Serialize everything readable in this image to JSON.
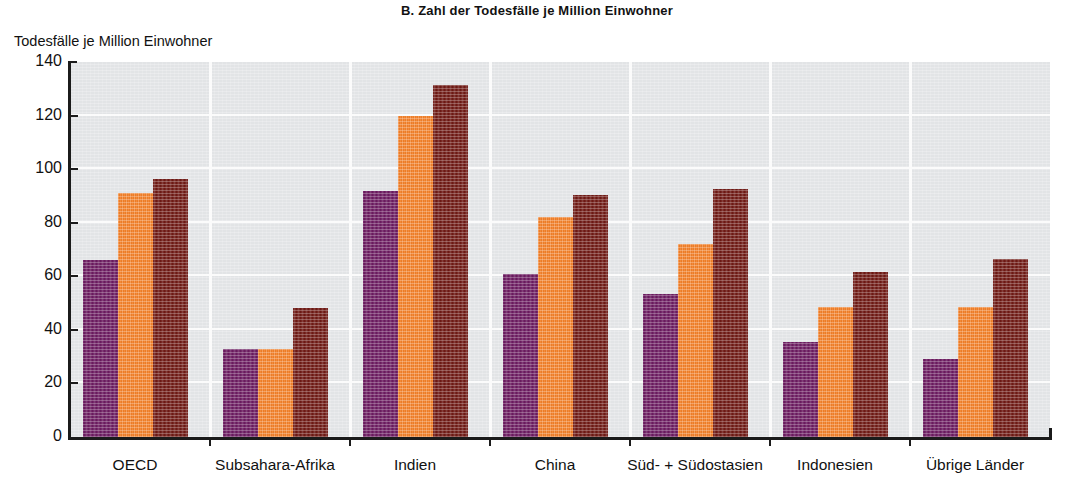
{
  "chart_data": {
    "type": "bar",
    "title": "B. Zahl der Todesfälle je Million Einwohner",
    "ylabel": "Todesfälle je Million Einwohner",
    "xlabel": "",
    "ylim": [
      0,
      140
    ],
    "yticks": [
      0,
      20,
      40,
      60,
      80,
      100,
      120,
      140
    ],
    "ytick_labels": [
      "0",
      "20",
      "40",
      "60",
      "80",
      "100",
      "120",
      "140"
    ],
    "grid": "horizontal-and-group-separators",
    "legend": "none",
    "categories": [
      "OECD",
      "Subsahara-Afrika",
      "Indien",
      "China",
      "Süd- + Südostasien",
      "Indonesien",
      "Übrige Länder"
    ],
    "series": [
      {
        "name": "Serie 1",
        "color": "#6d1c61",
        "values": [
          66,
          33,
          92,
          61,
          53.5,
          35.5,
          29
        ]
      },
      {
        "name": "Serie 2",
        "color": "#f4822b",
        "values": [
          91,
          33,
          120,
          82,
          72,
          48.5,
          48.5
        ]
      },
      {
        "name": "Serie 3",
        "color": "#701a15",
        "values": [
          96.5,
          48,
          131.5,
          90.5,
          92.5,
          61.5,
          66.5
        ]
      }
    ],
    "plot_background": "#e2e4e6",
    "gridline_color": "#fbfbfb",
    "axis_color": "#1b1b1b"
  }
}
